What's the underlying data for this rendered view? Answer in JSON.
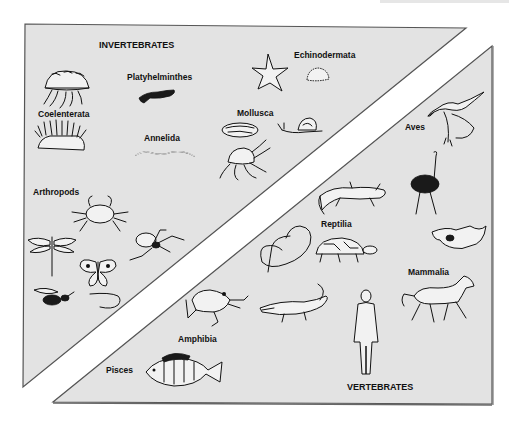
{
  "diagram": {
    "type": "classification",
    "groups": [
      {
        "id": "invertebrates",
        "title": "INVERTEBRATES",
        "fill": "#e3e3e3",
        "border": "#555555",
        "phyla": [
          {
            "label": "Coelenterata",
            "animals": [
              "jellyfish",
              "sea anemone"
            ]
          },
          {
            "label": "Platyhelminthes",
            "animals": [
              "flatworm"
            ]
          },
          {
            "label": "Echinodermata",
            "animals": [
              "starfish",
              "sea urchin"
            ]
          },
          {
            "label": "Mollusca",
            "animals": [
              "mussel",
              "snail",
              "octopus"
            ]
          },
          {
            "label": "Annelida",
            "animals": [
              "earthworm"
            ]
          },
          {
            "label": "Arthropods",
            "animals": [
              "crab",
              "dragonfly",
              "spider",
              "butterfly",
              "wasp",
              "centipede"
            ]
          }
        ]
      },
      {
        "id": "vertebrates",
        "title": "VERTEBRATES",
        "fill": "#e3e3e3",
        "border": "#555555",
        "classes": [
          {
            "label": "Aves",
            "animals": [
              "seagull",
              "ostrich"
            ]
          },
          {
            "label": "Reptilia",
            "animals": [
              "lizard",
              "snake",
              "tortoise",
              "crocodile"
            ]
          },
          {
            "label": "Mammalia",
            "animals": [
              "bat",
              "horse",
              "human"
            ]
          },
          {
            "label": "Amphibia",
            "animals": [
              "frog"
            ]
          },
          {
            "label": "Pisces",
            "animals": [
              "perch"
            ]
          }
        ]
      }
    ]
  },
  "labels": {
    "invertebrates": "INVERTEBRATES",
    "vertebrates": "VERTEBRATES",
    "coelenterata": "Coelenterata",
    "platyhelminthes": "Platyhelminthes",
    "echinodermata": "Echinodermata",
    "mollusca": "Mollusca",
    "annelida": "Annelida",
    "arthropods": "Arthropods",
    "aves": "Aves",
    "reptilia": "Reptilia",
    "mammalia": "Mammalia",
    "amphibia": "Amphibia",
    "pisces": "Pisces"
  },
  "colors": {
    "panel_fill": "#e3e3e3",
    "panel_border": "#555555",
    "ink": "#111111",
    "background": "#ffffff"
  }
}
